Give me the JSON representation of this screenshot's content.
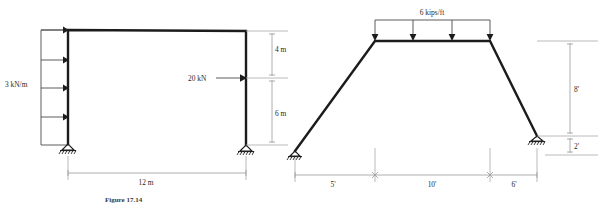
{
  "figure": {
    "caption": "Figure 17.14",
    "background_color": "#ffffff",
    "member_color": "#1c1c1c",
    "dimension_color": "#9a9a9a"
  },
  "left_frame": {
    "name": "portal-frame-metric",
    "distributed_load": {
      "label": "3 kN/m",
      "direction": "horizontal-right",
      "arrow_count": 4,
      "applied_to": "left-column"
    },
    "point_load": {
      "label": "20 kN",
      "direction": "horizontal-right",
      "applied_to": "right-column"
    },
    "dimensions": [
      {
        "label": "4 m",
        "orientation": "vertical",
        "position": "upper-right"
      },
      {
        "label": "6 m",
        "orientation": "vertical",
        "position": "lower-right"
      },
      {
        "label": "12 m",
        "orientation": "horizontal",
        "position": "bottom"
      }
    ],
    "supports": [
      {
        "type": "pinned",
        "position": "base-left"
      },
      {
        "type": "pinned",
        "position": "base-right"
      }
    ]
  },
  "right_frame": {
    "name": "gable-frame-imperial",
    "distributed_load": {
      "label": "6 kips/ft",
      "direction": "vertical-down",
      "arrow_count": 4,
      "applied_to": "top-beam"
    },
    "dimensions": [
      {
        "label": "5'",
        "orientation": "horizontal",
        "position": "bottom-left"
      },
      {
        "label": "10'",
        "orientation": "horizontal",
        "position": "bottom-center"
      },
      {
        "label": "6'",
        "orientation": "horizontal",
        "position": "bottom-right"
      },
      {
        "label": "8'",
        "orientation": "vertical",
        "position": "right-upper"
      },
      {
        "label": "2'",
        "orientation": "vertical",
        "position": "right-lower"
      }
    ],
    "supports": [
      {
        "type": "pinned",
        "position": "base-left"
      },
      {
        "type": "pinned",
        "position": "base-right"
      }
    ]
  }
}
